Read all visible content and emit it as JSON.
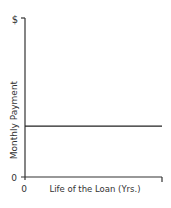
{
  "chart_data": {
    "type": "line",
    "title": "",
    "xlabel": "Life of the Loan (Yrs.)",
    "ylabel": "Monthly Payment",
    "x_tick_labels": [
      "0"
    ],
    "y_tick_labels": [
      "0",
      "$"
    ],
    "xlim": [
      0,
      1
    ],
    "ylim": [
      0,
      1
    ],
    "grid": false,
    "legend": "none",
    "series": [
      {
        "name": "Monthly Payment",
        "x": [
          0,
          1
        ],
        "y": [
          0.32,
          0.32
        ],
        "color": "#222222"
      }
    ]
  }
}
